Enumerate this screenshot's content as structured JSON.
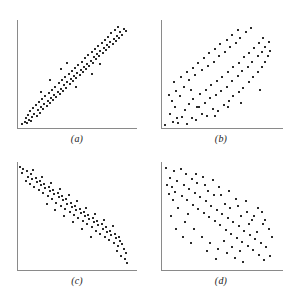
{
  "figure": {
    "background_color": "#ffffff",
    "point_color": "#2b2b2b",
    "axis_color": "#8a8a8a",
    "width": 289,
    "height": 306
  },
  "panels": [
    {
      "id": "a",
      "label": "(a)",
      "description": "strong positive linear correlation scatterplot"
    },
    {
      "id": "b",
      "label": "(b)",
      "description": "moderate positive linear correlation scatterplot"
    },
    {
      "id": "c",
      "label": "(c)",
      "description": "strong negative linear correlation scatterplot"
    },
    {
      "id": "d",
      "label": "(d)",
      "description": "moderate negative linear correlation scatterplot"
    }
  ],
  "chart_data": [
    {
      "type": "scatter",
      "title": "(a)",
      "xlabel": "",
      "ylabel": "",
      "xlim": [
        0,
        100
      ],
      "ylim": [
        0,
        100
      ],
      "grid": false,
      "legend": "none",
      "correlation": "strong positive",
      "points": [
        [
          3,
          2
        ],
        [
          5,
          4
        ],
        [
          7,
          3
        ],
        [
          6,
          8
        ],
        [
          9,
          6
        ],
        [
          11,
          5
        ],
        [
          8,
          11
        ],
        [
          12,
          9
        ],
        [
          10,
          14
        ],
        [
          14,
          12
        ],
        [
          16,
          10
        ],
        [
          13,
          17
        ],
        [
          17,
          15
        ],
        [
          19,
          13
        ],
        [
          15,
          20
        ],
        [
          20,
          18
        ],
        [
          22,
          16
        ],
        [
          18,
          23
        ],
        [
          23,
          21
        ],
        [
          25,
          19
        ],
        [
          21,
          26
        ],
        [
          26,
          24
        ],
        [
          28,
          22
        ],
        [
          24,
          29
        ],
        [
          29,
          27
        ],
        [
          31,
          25
        ],
        [
          27,
          32
        ],
        [
          32,
          30
        ],
        [
          34,
          28
        ],
        [
          30,
          35
        ],
        [
          35,
          33
        ],
        [
          37,
          31
        ],
        [
          33,
          38
        ],
        [
          38,
          36
        ],
        [
          40,
          34
        ],
        [
          36,
          41
        ],
        [
          41,
          39
        ],
        [
          43,
          37
        ],
        [
          39,
          44
        ],
        [
          44,
          42
        ],
        [
          46,
          40
        ],
        [
          42,
          47
        ],
        [
          47,
          45
        ],
        [
          49,
          43
        ],
        [
          45,
          50
        ],
        [
          50,
          48
        ],
        [
          52,
          46
        ],
        [
          48,
          53
        ],
        [
          53,
          51
        ],
        [
          55,
          49
        ],
        [
          51,
          56
        ],
        [
          56,
          54
        ],
        [
          58,
          52
        ],
        [
          54,
          59
        ],
        [
          59,
          57
        ],
        [
          61,
          55
        ],
        [
          57,
          62
        ],
        [
          62,
          60
        ],
        [
          64,
          58
        ],
        [
          60,
          65
        ],
        [
          65,
          63
        ],
        [
          67,
          61
        ],
        [
          63,
          68
        ],
        [
          68,
          66
        ],
        [
          70,
          64
        ],
        [
          66,
          71
        ],
        [
          71,
          69
        ],
        [
          73,
          67
        ],
        [
          69,
          74
        ],
        [
          74,
          72
        ],
        [
          76,
          70
        ],
        [
          72,
          77
        ],
        [
          77,
          75
        ],
        [
          79,
          73
        ],
        [
          75,
          80
        ],
        [
          80,
          78
        ],
        [
          82,
          76
        ],
        [
          78,
          83
        ],
        [
          83,
          81
        ],
        [
          85,
          79
        ],
        [
          81,
          86
        ],
        [
          86,
          84
        ],
        [
          88,
          82
        ],
        [
          84,
          89
        ],
        [
          89,
          87
        ],
        [
          91,
          85
        ],
        [
          87,
          92
        ],
        [
          92,
          90
        ],
        [
          94,
          88
        ],
        [
          90,
          95
        ],
        [
          95,
          93
        ],
        [
          97,
          91
        ],
        [
          44,
          61
        ],
        [
          38,
          55
        ],
        [
          52,
          38
        ],
        [
          28,
          44
        ],
        [
          66,
          50
        ],
        [
          20,
          33
        ],
        [
          74,
          60
        ]
      ]
    },
    {
      "type": "scatter",
      "title": "(b)",
      "xlabel": "",
      "ylabel": "",
      "xlim": [
        0,
        100
      ],
      "ylim": [
        0,
        100
      ],
      "grid": false,
      "legend": "none",
      "correlation": "moderate positive",
      "points": [
        [
          2,
          1
        ],
        [
          9,
          4
        ],
        [
          14,
          3
        ],
        [
          22,
          2
        ],
        [
          6,
          12
        ],
        [
          17,
          9
        ],
        [
          26,
          8
        ],
        [
          11,
          18
        ],
        [
          30,
          6
        ],
        [
          20,
          15
        ],
        [
          35,
          12
        ],
        [
          8,
          24
        ],
        [
          24,
          21
        ],
        [
          40,
          10
        ],
        [
          15,
          29
        ],
        [
          31,
          18
        ],
        [
          45,
          16
        ],
        [
          12,
          34
        ],
        [
          27,
          26
        ],
        [
          38,
          22
        ],
        [
          50,
          14
        ],
        [
          19,
          38
        ],
        [
          34,
          31
        ],
        [
          43,
          27
        ],
        [
          55,
          20
        ],
        [
          10,
          42
        ],
        [
          24,
          44
        ],
        [
          39,
          35
        ],
        [
          48,
          30
        ],
        [
          60,
          24
        ],
        [
          16,
          47
        ],
        [
          29,
          49
        ],
        [
          44,
          39
        ],
        [
          53,
          34
        ],
        [
          64,
          29
        ],
        [
          22,
          52
        ],
        [
          35,
          54
        ],
        [
          49,
          43
        ],
        [
          58,
          38
        ],
        [
          69,
          33
        ],
        [
          27,
          56
        ],
        [
          41,
          58
        ],
        [
          54,
          47
        ],
        [
          63,
          43
        ],
        [
          73,
          37
        ],
        [
          32,
          61
        ],
        [
          46,
          62
        ],
        [
          59,
          52
        ],
        [
          68,
          48
        ],
        [
          78,
          42
        ],
        [
          37,
          65
        ],
        [
          51,
          67
        ],
        [
          64,
          57
        ],
        [
          72,
          53
        ],
        [
          82,
          47
        ],
        [
          42,
          70
        ],
        [
          56,
          71
        ],
        [
          69,
          61
        ],
        [
          77,
          57
        ],
        [
          86,
          52
        ],
        [
          47,
          74
        ],
        [
          61,
          76
        ],
        [
          74,
          66
        ],
        [
          81,
          62
        ],
        [
          90,
          57
        ],
        [
          52,
          79
        ],
        [
          66,
          80
        ],
        [
          78,
          70
        ],
        [
          86,
          67
        ],
        [
          93,
          62
        ],
        [
          58,
          83
        ],
        [
          70,
          85
        ],
        [
          83,
          75
        ],
        [
          90,
          71
        ],
        [
          95,
          67
        ],
        [
          63,
          88
        ],
        [
          75,
          90
        ],
        [
          87,
          80
        ],
        [
          93,
          76
        ],
        [
          97,
          72
        ],
        [
          68,
          92
        ],
        [
          80,
          94
        ],
        [
          91,
          85
        ],
        [
          96,
          81
        ],
        [
          33,
          18
        ],
        [
          47,
          10
        ],
        [
          59,
          18
        ],
        [
          25,
          35
        ],
        [
          71,
          22
        ],
        [
          13,
          8
        ],
        [
          5,
          30
        ],
        [
          88,
          35
        ]
      ]
    },
    {
      "type": "scatter",
      "title": "(c)",
      "xlabel": "",
      "ylabel": "",
      "xlim": [
        0,
        100
      ],
      "ylim": [
        0,
        100
      ],
      "grid": false,
      "legend": "none",
      "correlation": "strong negative",
      "points": [
        [
          1,
          97
        ],
        [
          4,
          95
        ],
        [
          3,
          91
        ],
        [
          7,
          93
        ],
        [
          8,
          88
        ],
        [
          6,
          84
        ],
        [
          11,
          90
        ],
        [
          12,
          86
        ],
        [
          10,
          81
        ],
        [
          15,
          87
        ],
        [
          16,
          83
        ],
        [
          14,
          78
        ],
        [
          19,
          84
        ],
        [
          20,
          80
        ],
        [
          18,
          75
        ],
        [
          23,
          81
        ],
        [
          24,
          77
        ],
        [
          22,
          72
        ],
        [
          27,
          78
        ],
        [
          28,
          74
        ],
        [
          26,
          69
        ],
        [
          31,
          75
        ],
        [
          32,
          71
        ],
        [
          30,
          66
        ],
        [
          35,
          72
        ],
        [
          36,
          68
        ],
        [
          34,
          63
        ],
        [
          39,
          69
        ],
        [
          40,
          65
        ],
        [
          38,
          60
        ],
        [
          43,
          66
        ],
        [
          44,
          62
        ],
        [
          42,
          57
        ],
        [
          47,
          63
        ],
        [
          48,
          59
        ],
        [
          46,
          54
        ],
        [
          51,
          60
        ],
        [
          52,
          56
        ],
        [
          50,
          51
        ],
        [
          55,
          57
        ],
        [
          56,
          53
        ],
        [
          54,
          48
        ],
        [
          59,
          54
        ],
        [
          60,
          50
        ],
        [
          58,
          45
        ],
        [
          63,
          51
        ],
        [
          64,
          47
        ],
        [
          62,
          42
        ],
        [
          67,
          48
        ],
        [
          68,
          44
        ],
        [
          66,
          39
        ],
        [
          71,
          45
        ],
        [
          72,
          41
        ],
        [
          70,
          36
        ],
        [
          75,
          42
        ],
        [
          76,
          38
        ],
        [
          74,
          33
        ],
        [
          79,
          39
        ],
        [
          80,
          35
        ],
        [
          78,
          30
        ],
        [
          83,
          36
        ],
        [
          84,
          32
        ],
        [
          82,
          27
        ],
        [
          87,
          33
        ],
        [
          88,
          29
        ],
        [
          86,
          24
        ],
        [
          91,
          30
        ],
        [
          92,
          26
        ],
        [
          90,
          21
        ],
        [
          94,
          23
        ],
        [
          95,
          18
        ],
        [
          97,
          14
        ],
        [
          96,
          9
        ],
        [
          98,
          5
        ],
        [
          93,
          12
        ],
        [
          89,
          16
        ],
        [
          45,
          70
        ],
        [
          53,
          64
        ],
        [
          61,
          58
        ],
        [
          37,
          76
        ],
        [
          29,
          82
        ],
        [
          69,
          52
        ],
        [
          77,
          46
        ],
        [
          85,
          40
        ],
        [
          21,
          88
        ],
        [
          13,
          94
        ],
        [
          57,
          38
        ],
        [
          65,
          30
        ],
        [
          49,
          44
        ],
        [
          41,
          50
        ],
        [
          33,
          56
        ],
        [
          25,
          62
        ]
      ]
    },
    {
      "type": "scatter",
      "title": "(d)",
      "xlabel": "",
      "ylabel": "",
      "xlim": [
        0,
        100
      ],
      "ylim": [
        0,
        100
      ],
      "grid": false,
      "legend": "none",
      "correlation": "moderate negative",
      "points": [
        [
          3,
          96
        ],
        [
          10,
          93
        ],
        [
          6,
          87
        ],
        [
          16,
          95
        ],
        [
          13,
          84
        ],
        [
          8,
          78
        ],
        [
          21,
          90
        ],
        [
          19,
          80
        ],
        [
          11,
          73
        ],
        [
          26,
          86
        ],
        [
          24,
          76
        ],
        [
          17,
          69
        ],
        [
          31,
          82
        ],
        [
          29,
          72
        ],
        [
          22,
          65
        ],
        [
          36,
          88
        ],
        [
          34,
          68
        ],
        [
          27,
          61
        ],
        [
          41,
          74
        ],
        [
          39,
          64
        ],
        [
          32,
          57
        ],
        [
          46,
          70
        ],
        [
          44,
          60
        ],
        [
          37,
          53
        ],
        [
          51,
          78
        ],
        [
          49,
          56
        ],
        [
          42,
          49
        ],
        [
          56,
          62
        ],
        [
          54,
          52
        ],
        [
          47,
          45
        ],
        [
          61,
          58
        ],
        [
          59,
          48
        ],
        [
          52,
          41
        ],
        [
          66,
          66
        ],
        [
          64,
          44
        ],
        [
          57,
          37
        ],
        [
          71,
          50
        ],
        [
          69,
          40
        ],
        [
          62,
          33
        ],
        [
          76,
          54
        ],
        [
          74,
          36
        ],
        [
          67,
          29
        ],
        [
          81,
          46
        ],
        [
          79,
          32
        ],
        [
          72,
          25
        ],
        [
          86,
          58
        ],
        [
          84,
          28
        ],
        [
          77,
          21
        ],
        [
          91,
          42
        ],
        [
          89,
          24
        ],
        [
          82,
          17
        ],
        [
          96,
          38
        ],
        [
          94,
          20
        ],
        [
          87,
          13
        ],
        [
          99,
          30
        ],
        [
          97,
          12
        ],
        [
          92,
          8
        ],
        [
          14,
          58
        ],
        [
          20,
          44
        ],
        [
          28,
          38
        ],
        [
          35,
          30
        ],
        [
          43,
          24
        ],
        [
          50,
          18
        ],
        [
          9,
          65
        ],
        [
          5,
          71
        ],
        [
          58,
          14
        ],
        [
          65,
          10
        ],
        [
          73,
          6
        ],
        [
          23,
          52
        ],
        [
          30,
          90
        ],
        [
          38,
          80
        ],
        [
          45,
          85
        ],
        [
          53,
          70
        ],
        [
          60,
          74
        ],
        [
          68,
          60
        ],
        [
          75,
          64
        ],
        [
          83,
          50
        ],
        [
          90,
          54
        ],
        [
          12,
          38
        ],
        [
          18,
          30
        ],
        [
          25,
          24
        ],
        [
          40,
          16
        ],
        [
          48,
          9
        ],
        [
          55,
          26
        ],
        [
          63,
          20
        ],
        [
          70,
          16
        ],
        [
          78,
          42
        ],
        [
          85,
          35
        ],
        [
          93,
          46
        ],
        [
          4,
          80
        ],
        [
          7,
          50
        ]
      ]
    }
  ]
}
